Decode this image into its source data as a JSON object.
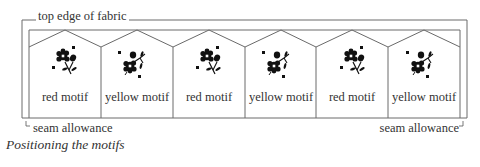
{
  "diagram": {
    "top_label": "top edge of fabric",
    "columns": [
      {
        "label": "red motif",
        "variant": "red",
        "flower_orientation": "a"
      },
      {
        "label": "yellow motif",
        "variant": "yellow",
        "flower_orientation": "b"
      },
      {
        "label": "red motif",
        "variant": "red",
        "flower_orientation": "a"
      },
      {
        "label": "yellow motif",
        "variant": "yellow",
        "flower_orientation": "b"
      },
      {
        "label": "red motif",
        "variant": "red",
        "flower_orientation": "a"
      },
      {
        "label": "yellow motif",
        "variant": "yellow",
        "flower_orientation": "b"
      }
    ],
    "seam_left": "seam allowance",
    "seam_right": "seam allowance",
    "caption": "Positioning the motifs",
    "colors": {
      "line": "#6a6a6a",
      "motif": "#111111",
      "text": "#333333"
    }
  }
}
